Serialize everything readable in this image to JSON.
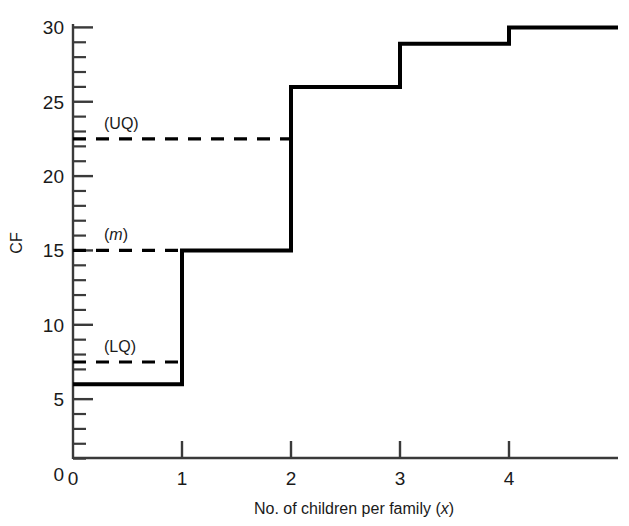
{
  "chart_data": {
    "type": "line",
    "subtype": "step-cumulative-frequency-ogive",
    "title": "",
    "xlabel_parts": {
      "main": "No. of children per family (",
      "var": "x",
      "close": ")"
    },
    "xlabel": "No. of children per family (x)",
    "ylabel": "CF",
    "xlim": [
      0,
      5
    ],
    "ylim": [
      0,
      30
    ],
    "x_ticks": [
      0,
      1,
      2,
      3,
      4
    ],
    "x_tick_labels": [
      "0",
      "1",
      "2",
      "3",
      "4"
    ],
    "y_ticks": [
      0,
      5,
      10,
      15,
      20,
      25,
      30
    ],
    "y_tick_labels": [
      "0",
      "5",
      "10",
      "15",
      "20",
      "25",
      "30"
    ],
    "y_minor_tick_step": 1,
    "grid": false,
    "legend": "none",
    "series": [
      {
        "name": "Cumulative frequency",
        "style": "step-post",
        "color": "#000000",
        "linewidth": 4,
        "x": [
          0,
          1,
          2,
          3,
          4,
          5
        ],
        "values": [
          6,
          15,
          26,
          28.9,
          30,
          30
        ],
        "points": [
          {
            "x_start": 0,
            "x_end": 1,
            "cf": 6
          },
          {
            "x_start": 1,
            "x_end": 2,
            "cf": 15
          },
          {
            "x_start": 2,
            "x_end": 3,
            "cf": 26
          },
          {
            "x_start": 3,
            "x_end": 4,
            "cf": 28.9
          },
          {
            "x_start": 4,
            "x_end": 5,
            "cf": 30
          }
        ]
      }
    ],
    "annotations": [
      {
        "id": "uq",
        "label": "(UQ)",
        "italic": false,
        "cf": 22.5,
        "x_from": 0,
        "x_to": 2.0,
        "style": "dashed",
        "color": "#000000"
      },
      {
        "id": "median",
        "label": "(m)",
        "italic": true,
        "label_text_open": "(",
        "label_text_var": "m",
        "label_text_close": ")",
        "cf": 15,
        "x_from": 0,
        "x_to": 1.0,
        "style": "dashed",
        "color": "#000000"
      },
      {
        "id": "lq",
        "label": "(LQ)",
        "italic": false,
        "cf": 7.5,
        "x_from": 0,
        "x_to": 1.0,
        "style": "dashed",
        "color": "#000000"
      }
    ]
  },
  "colors": {
    "ink": "#1a1a1a",
    "line": "#000000",
    "axis": "#3a3a3a",
    "background": "#ffffff"
  }
}
